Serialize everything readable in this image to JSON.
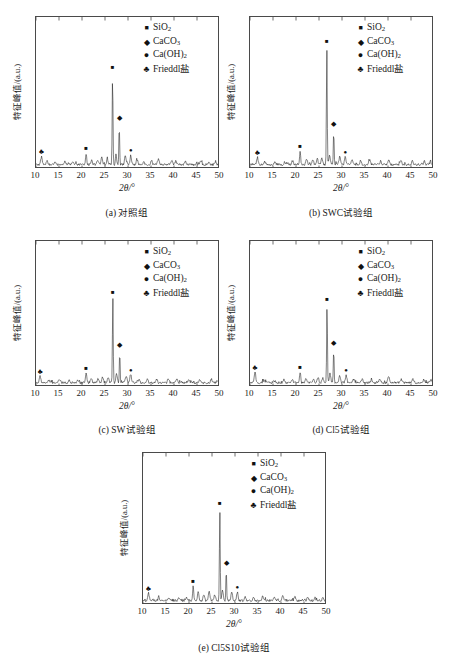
{
  "figure": {
    "axis": {
      "xlabel_symbol": "2θ/",
      "xlabel_unit": "°",
      "ylabel": "特征峰值/(a.u.)",
      "xticks": [
        10,
        15,
        20,
        25,
        30,
        35,
        40,
        45,
        50
      ],
      "xlim": [
        10,
        50
      ],
      "ylim": [
        0,
        100
      ]
    },
    "legend": [
      {
        "marker": "square",
        "glyph": "■",
        "label_html": "SiO<sub>2</sub>",
        "label": "SiO2"
      },
      {
        "marker": "diamond",
        "glyph": "◆",
        "label_html": "CaCO<sub>3</sub>",
        "label": "CaCO3"
      },
      {
        "marker": "dot",
        "glyph": "●",
        "label_html": "Ca(OH)<sub>2</sub>",
        "label": "Ca(OH)2"
      },
      {
        "marker": "clover",
        "glyph": "♣",
        "label_html": "Frieddl盐",
        "label": "Frieddl盐"
      }
    ],
    "panels": [
      {
        "id": "panel-a",
        "caption": "(a) 对照组",
        "main_peak_height": 62,
        "peaks": [
          {
            "x": 11.2,
            "h": 5.5
          },
          {
            "x": 12.4,
            "h": 2.0
          },
          {
            "x": 14.1,
            "h": 1.6
          },
          {
            "x": 16.3,
            "h": 2.2
          },
          {
            "x": 18.0,
            "h": 1.7
          },
          {
            "x": 20.9,
            "h": 7.5
          },
          {
            "x": 22.1,
            "h": 3.4
          },
          {
            "x": 23.4,
            "h": 3.0
          },
          {
            "x": 24.3,
            "h": 4.6
          },
          {
            "x": 25.5,
            "h": 3.8
          },
          {
            "x": 26.65,
            "h": 62
          },
          {
            "x": 27.4,
            "h": 8.0
          },
          {
            "x": 28.1,
            "h": 27
          },
          {
            "x": 29.4,
            "h": 6.5
          },
          {
            "x": 30.6,
            "h": 6.2
          },
          {
            "x": 32.0,
            "h": 3.0
          },
          {
            "x": 33.4,
            "h": 2.6
          },
          {
            "x": 35.1,
            "h": 2.8
          },
          {
            "x": 36.6,
            "h": 3.6
          },
          {
            "x": 39.5,
            "h": 3.4
          },
          {
            "x": 40.4,
            "h": 2.6
          },
          {
            "x": 42.5,
            "h": 2.8
          },
          {
            "x": 45.9,
            "h": 2.4
          },
          {
            "x": 47.6,
            "h": 2.2
          },
          {
            "x": 49.0,
            "h": 1.9
          }
        ],
        "markers": [
          {
            "type": "clover",
            "x": 11.2,
            "h": 7.5
          },
          {
            "type": "square",
            "x": 20.9,
            "h": 10.0
          },
          {
            "type": "square",
            "x": 26.65,
            "h": 65.5
          },
          {
            "type": "diamond",
            "x": 28.1,
            "h": 30.5
          },
          {
            "type": "dot",
            "x": 30.6,
            "h": 8.6
          }
        ]
      },
      {
        "id": "panel-b",
        "caption": "(b) SWC试验组",
        "main_peak_height": 80,
        "peaks": [
          {
            "x": 11.6,
            "h": 5.0
          },
          {
            "x": 13.2,
            "h": 1.8
          },
          {
            "x": 15.4,
            "h": 2.0
          },
          {
            "x": 17.6,
            "h": 1.9
          },
          {
            "x": 19.3,
            "h": 2.3
          },
          {
            "x": 20.9,
            "h": 9.0
          },
          {
            "x": 22.3,
            "h": 3.6
          },
          {
            "x": 23.6,
            "h": 3.2
          },
          {
            "x": 24.6,
            "h": 4.4
          },
          {
            "x": 25.6,
            "h": 4.0
          },
          {
            "x": 26.7,
            "h": 80
          },
          {
            "x": 27.3,
            "h": 7.0
          },
          {
            "x": 28.2,
            "h": 23
          },
          {
            "x": 29.5,
            "h": 5.4
          },
          {
            "x": 30.7,
            "h": 5.0
          },
          {
            "x": 32.2,
            "h": 3.0
          },
          {
            "x": 34.0,
            "h": 2.4
          },
          {
            "x": 36.0,
            "h": 3.2
          },
          {
            "x": 38.4,
            "h": 2.8
          },
          {
            "x": 40.2,
            "h": 3.2
          },
          {
            "x": 42.8,
            "h": 2.6
          },
          {
            "x": 45.3,
            "h": 2.4
          },
          {
            "x": 47.9,
            "h": 2.2
          },
          {
            "x": 49.2,
            "h": 2.0
          }
        ],
        "markers": [
          {
            "type": "clover",
            "x": 11.6,
            "h": 7.0
          },
          {
            "type": "square",
            "x": 20.9,
            "h": 11.5
          },
          {
            "type": "square",
            "x": 26.7,
            "h": 83.5
          },
          {
            "type": "diamond",
            "x": 28.2,
            "h": 26.5
          },
          {
            "type": "dot",
            "x": 30.7,
            "h": 7.4
          }
        ]
      },
      {
        "id": "panel-c",
        "caption": "(c) SW试验组",
        "main_peak_height": 60,
        "peaks": [
          {
            "x": 10.9,
            "h": 4.5
          },
          {
            "x": 12.8,
            "h": 1.8
          },
          {
            "x": 15.0,
            "h": 2.0
          },
          {
            "x": 17.2,
            "h": 2.1
          },
          {
            "x": 19.0,
            "h": 1.8
          },
          {
            "x": 20.9,
            "h": 7.0
          },
          {
            "x": 22.0,
            "h": 3.2
          },
          {
            "x": 23.5,
            "h": 3.0
          },
          {
            "x": 24.5,
            "h": 3.8
          },
          {
            "x": 25.7,
            "h": 3.4
          },
          {
            "x": 26.7,
            "h": 60
          },
          {
            "x": 27.5,
            "h": 6.0
          },
          {
            "x": 28.2,
            "h": 22
          },
          {
            "x": 29.6,
            "h": 5.2
          },
          {
            "x": 30.6,
            "h": 5.6
          },
          {
            "x": 32.4,
            "h": 2.8
          },
          {
            "x": 34.2,
            "h": 2.4
          },
          {
            "x": 36.2,
            "h": 2.9
          },
          {
            "x": 38.8,
            "h": 2.6
          },
          {
            "x": 40.6,
            "h": 3.0
          },
          {
            "x": 43.2,
            "h": 2.5
          },
          {
            "x": 45.6,
            "h": 2.3
          },
          {
            "x": 48.1,
            "h": 2.1
          },
          {
            "x": 49.4,
            "h": 1.9
          }
        ],
        "markers": [
          {
            "type": "clover",
            "x": 10.9,
            "h": 6.6
          },
          {
            "type": "square",
            "x": 20.9,
            "h": 9.5
          },
          {
            "type": "square",
            "x": 26.7,
            "h": 63.5
          },
          {
            "type": "diamond",
            "x": 28.2,
            "h": 25.5
          },
          {
            "type": "dot",
            "x": 30.6,
            "h": 8.0
          }
        ]
      },
      {
        "id": "panel-d",
        "caption": "(d) Cl5试验组",
        "main_peak_height": 55,
        "peaks": [
          {
            "x": 11.1,
            "h": 7.0
          },
          {
            "x": 13.0,
            "h": 2.0
          },
          {
            "x": 15.2,
            "h": 1.8
          },
          {
            "x": 17.4,
            "h": 2.2
          },
          {
            "x": 19.2,
            "h": 2.0
          },
          {
            "x": 20.9,
            "h": 7.5
          },
          {
            "x": 22.2,
            "h": 3.0
          },
          {
            "x": 23.8,
            "h": 2.8
          },
          {
            "x": 24.8,
            "h": 3.6
          },
          {
            "x": 25.8,
            "h": 3.2
          },
          {
            "x": 26.75,
            "h": 55
          },
          {
            "x": 27.4,
            "h": 6.4
          },
          {
            "x": 28.2,
            "h": 24
          },
          {
            "x": 29.5,
            "h": 5.0
          },
          {
            "x": 30.9,
            "h": 5.4
          },
          {
            "x": 32.6,
            "h": 2.6
          },
          {
            "x": 34.4,
            "h": 2.5
          },
          {
            "x": 36.4,
            "h": 2.8
          },
          {
            "x": 38.2,
            "h": 2.6
          },
          {
            "x": 40.1,
            "h": 5.0
          },
          {
            "x": 42.9,
            "h": 2.5
          },
          {
            "x": 45.4,
            "h": 2.4
          },
          {
            "x": 47.8,
            "h": 2.2
          },
          {
            "x": 49.3,
            "h": 2.0
          }
        ],
        "markers": [
          {
            "type": "clover",
            "x": 11.1,
            "h": 9.0
          },
          {
            "type": "square",
            "x": 20.9,
            "h": 10.0
          },
          {
            "type": "square",
            "x": 26.75,
            "h": 58.5
          },
          {
            "type": "diamond",
            "x": 28.2,
            "h": 27.5
          },
          {
            "type": "dot",
            "x": 30.9,
            "h": 7.8
          }
        ]
      },
      {
        "id": "panel-e",
        "caption": "(e) Cl5S10试验组",
        "main_peak_height": 62,
        "peaks": [
          {
            "x": 11.2,
            "h": 5.0
          },
          {
            "x": 13.4,
            "h": 1.8
          },
          {
            "x": 15.6,
            "h": 2.0
          },
          {
            "x": 17.8,
            "h": 2.2
          },
          {
            "x": 19.4,
            "h": 2.0
          },
          {
            "x": 20.9,
            "h": 9.5
          },
          {
            "x": 22.0,
            "h": 6.0
          },
          {
            "x": 23.2,
            "h": 4.0
          },
          {
            "x": 24.4,
            "h": 6.5
          },
          {
            "x": 25.6,
            "h": 4.2
          },
          {
            "x": 26.7,
            "h": 62
          },
          {
            "x": 27.3,
            "h": 7.0
          },
          {
            "x": 28.1,
            "h": 21
          },
          {
            "x": 29.3,
            "h": 6.0
          },
          {
            "x": 30.5,
            "h": 5.8
          },
          {
            "x": 32.2,
            "h": 3.0
          },
          {
            "x": 34.0,
            "h": 2.6
          },
          {
            "x": 36.0,
            "h": 3.0
          },
          {
            "x": 38.6,
            "h": 2.8
          },
          {
            "x": 40.4,
            "h": 3.4
          },
          {
            "x": 43.0,
            "h": 2.8
          },
          {
            "x": 45.8,
            "h": 2.6
          },
          {
            "x": 47.4,
            "h": 2.4
          },
          {
            "x": 49.1,
            "h": 2.0
          }
        ],
        "markers": [
          {
            "type": "clover",
            "x": 11.2,
            "h": 7.0
          },
          {
            "type": "square",
            "x": 20.9,
            "h": 12.5
          },
          {
            "type": "square",
            "x": 26.7,
            "h": 65.5
          },
          {
            "type": "diamond",
            "x": 28.1,
            "h": 24.5
          },
          {
            "type": "dot",
            "x": 30.5,
            "h": 8.2
          }
        ]
      }
    ]
  },
  "chart_data": {
    "type": "line",
    "xlabel": "2θ/°",
    "ylabel": "特征峰值/(a.u.)",
    "xlim": [
      10,
      50
    ],
    "ylim": [
      0,
      100
    ],
    "grid": false,
    "legend_position": "top-right",
    "legend_entries": [
      "SiO2",
      "CaCO3",
      "Ca(OH)2",
      "Frieddl盐"
    ],
    "subplots": [
      {
        "label": "(a) 对照组",
        "x": [
          11.2,
          20.9,
          26.65,
          28.1,
          30.6
        ],
        "y": [
          5.5,
          7.5,
          62,
          27,
          6.2
        ],
        "phase": [
          "Frieddl盐",
          "SiO2",
          "SiO2",
          "CaCO3",
          "Ca(OH)2"
        ]
      },
      {
        "label": "(b) SWC试验组",
        "x": [
          11.6,
          20.9,
          26.7,
          28.2,
          30.7
        ],
        "y": [
          5.0,
          9.0,
          80,
          23,
          5.0
        ],
        "phase": [
          "Frieddl盐",
          "SiO2",
          "SiO2",
          "CaCO3",
          "Ca(OH)2"
        ]
      },
      {
        "label": "(c) SW试验组",
        "x": [
          10.9,
          20.9,
          26.7,
          28.2,
          30.6
        ],
        "y": [
          4.5,
          7.0,
          60,
          22,
          5.6
        ],
        "phase": [
          "Frieddl盐",
          "SiO2",
          "SiO2",
          "CaCO3",
          "Ca(OH)2"
        ]
      },
      {
        "label": "(d) Cl5试验组",
        "x": [
          11.1,
          20.9,
          26.75,
          28.2,
          30.9
        ],
        "y": [
          7.0,
          7.5,
          55,
          24,
          5.4
        ],
        "phase": [
          "Frieddl盐",
          "SiO2",
          "SiO2",
          "CaCO3",
          "Ca(OH)2"
        ]
      },
      {
        "label": "(e) Cl5S10试验组",
        "x": [
          11.2,
          20.9,
          26.7,
          28.1,
          30.5
        ],
        "y": [
          5.0,
          9.5,
          62,
          21,
          5.8
        ],
        "phase": [
          "Frieddl盐",
          "SiO2",
          "SiO2",
          "CaCO3",
          "Ca(OH)2"
        ]
      }
    ]
  }
}
